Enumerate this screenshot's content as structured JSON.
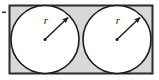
{
  "figure": {
    "name": "two-congruent-circles-inscribed-in-rectangle",
    "background_color": "#ffffff",
    "rectangle": {
      "name": "outer-rectangle",
      "x": 9.5,
      "y": 5.5,
      "width": 143,
      "height": 68,
      "fill_color": "#d8d8d8",
      "stroke_color": "#2b2b2b",
      "stroke_width": 2
    },
    "circles": [
      {
        "name": "left-circle",
        "cx": 45,
        "cy": 39.5,
        "r": 34,
        "fill_color": "#ffffff",
        "stroke_color": "#1a1a1a",
        "stroke_width": 1.6
      },
      {
        "name": "right-circle",
        "cx": 117,
        "cy": 39.5,
        "r": 34,
        "fill_color": "#ffffff",
        "stroke_color": "#1a1a1a",
        "stroke_width": 1.6
      }
    ],
    "radii": [
      {
        "name": "left-radius-arrow",
        "label": "r",
        "label_x": 46,
        "label_y": 24,
        "from_x": 45,
        "from_y": 39.5,
        "to_x": 69.5,
        "to_y": 16,
        "stroke_color": "#1a1a1a",
        "stroke_width": 1.4,
        "center_dot_color": "#1a1a1a",
        "center_dot_r": 1.5
      },
      {
        "name": "right-radius-arrow",
        "label": "r",
        "label_x": 118,
        "label_y": 24,
        "from_x": 117,
        "from_y": 39.5,
        "to_x": 141.5,
        "to_y": 16,
        "stroke_color": "#1a1a1a",
        "stroke_width": 1.4,
        "center_dot_color": "#1a1a1a",
        "center_dot_r": 1.5
      }
    ],
    "left_tick_mark": {
      "name": "left-edge-tick-mark",
      "x": 2,
      "y": 11.5,
      "width": 4,
      "height": 1.6,
      "color": "#3a3a3a"
    }
  }
}
